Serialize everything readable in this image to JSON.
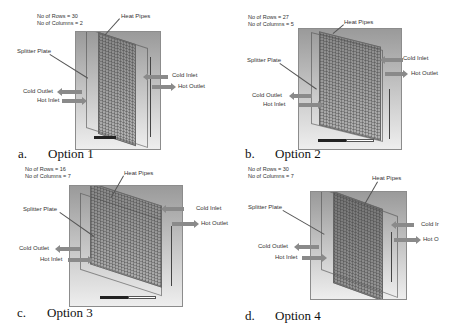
{
  "figure": {
    "panels": [
      {
        "id": "a",
        "caption_letter": "a.",
        "caption_label": "Option 1",
        "rows_text": "No of Rows = 30",
        "columns_text": "No of Columns = 2",
        "rows": 30,
        "columns": 2,
        "labels": {
          "heat_pipes": "Heat Pipes",
          "splitter_plate": "Splitter Plate",
          "cold_inlet": "Cold Inlet",
          "hot_outlet": "Hot Outlet",
          "cold_outlet": "Cold Outlet",
          "hot_inlet": "Hot Inlet"
        }
      },
      {
        "id": "b",
        "caption_letter": "b.",
        "caption_label": "Option 2",
        "rows_text": "No of Rows = 27",
        "columns_text": "No of Columns = 5",
        "rows": 27,
        "columns": 5,
        "labels": {
          "heat_pipes": "Heat Pipes",
          "splitter_plate": "Splitter Plate",
          "cold_inlet": "Cold Inlet",
          "hot_outlet": "Hot Outlet",
          "cold_outlet": "Cold Outlet",
          "hot_inlet": "Hot Inlet"
        }
      },
      {
        "id": "c",
        "caption_letter": "c.",
        "caption_label": "Option 3",
        "rows_text": "No of Rows = 16",
        "columns_text": "No of Columns = 7",
        "rows": 16,
        "columns": 7,
        "labels": {
          "heat_pipes": "Heat Pipes",
          "splitter_plate": "Splitter Plate",
          "cold_inlet": "Cold Inlet",
          "hot_outlet": "Hot Outlet",
          "cold_outlet": "Cold Outlet",
          "hot_inlet": "Hot Inlet"
        }
      },
      {
        "id": "d",
        "caption_letter": "d.",
        "caption_label": "Option 4",
        "rows_text": "No of Rows = 30",
        "columns_text": "No of Columns = 7",
        "rows": 30,
        "columns": 7,
        "labels": {
          "heat_pipes": "Heat Pipes",
          "splitter_plate": "Splitter Plate",
          "cold_inlet": "Cold Ir",
          "hot_outlet": "Hot O",
          "cold_outlet": "Cold Outlet",
          "hot_inlet": "Hot Inlet"
        }
      }
    ]
  }
}
